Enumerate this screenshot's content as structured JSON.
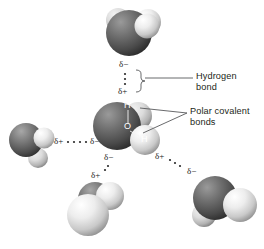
{
  "figure": {
    "background_color": "#ffffff",
    "ink_color": "#231f20"
  },
  "callouts": [
    {
      "id": "hydrogen-bond",
      "label": "Hydrogen\nbond",
      "x": 196,
      "y": 72
    },
    {
      "id": "polar-covalent-bonds",
      "label": "Polar covalent\nbonds",
      "x": 190,
      "y": 110
    }
  ],
  "atom_labels": [
    {
      "id": "h-top",
      "text": "H",
      "x": 124,
      "y": 106
    },
    {
      "id": "o-center",
      "text": "O",
      "x": 125,
      "y": 127
    },
    {
      "id": "h-right",
      "text": "H",
      "x": 142,
      "y": 140
    }
  ],
  "charges": [
    {
      "id": "top-mol-delta-minus",
      "text": "δ−",
      "x": 119,
      "y": 64
    },
    {
      "id": "center-mol-delta-plus-up",
      "text": "δ+",
      "x": 119,
      "y": 88
    },
    {
      "id": "left-mol-delta-plus",
      "text": "δ+",
      "x": 54,
      "y": 138
    },
    {
      "id": "center-mol-delta-minus-left",
      "text": "δ−",
      "x": 93,
      "y": 138
    },
    {
      "id": "center-mol-delta-minus-down",
      "text": "δ−",
      "x": 107,
      "y": 155
    },
    {
      "id": "bottom-mol-delta-plus",
      "text": "δ+",
      "x": 93,
      "y": 172
    },
    {
      "id": "center-mol-delta-plus-right",
      "text": "δ+",
      "x": 158,
      "y": 153
    },
    {
      "id": "right-mol-delta-minus",
      "text": "δ−",
      "x": 189,
      "y": 168
    }
  ],
  "molecules": [
    {
      "id": "molecule-top",
      "role": "hydrogen-bond-acceptor"
    },
    {
      "id": "molecule-center",
      "role": "central-water"
    },
    {
      "id": "molecule-left",
      "role": "hydrogen-bond-donor"
    },
    {
      "id": "molecule-bottom",
      "role": "hydrogen-bond-donor"
    },
    {
      "id": "molecule-right",
      "role": "hydrogen-bond-acceptor"
    }
  ]
}
